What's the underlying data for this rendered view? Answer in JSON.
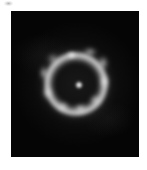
{
  "figure": {
    "name": "einstein-ring-image",
    "kind": "astronomical-image",
    "background_color": "#ffffff",
    "panel": {
      "x": 11,
      "y": 11,
      "width": 128,
      "height": 146,
      "background_color": "#050505"
    },
    "artifact": {
      "label": "",
      "x": 4,
      "y": 1,
      "width": 9,
      "height": 5,
      "color": "#787878"
    }
  },
  "objects": {
    "ring": {
      "label": "",
      "center_x": 65,
      "center_y": 73,
      "radius_x": 34,
      "radius_y": 34,
      "rotation_deg": -6,
      "peak_color": "#bebebe"
    },
    "halo": {
      "label": "",
      "center_x": 65,
      "center_y": 73,
      "radius_x": 40,
      "radius_y": 40,
      "color": "#3c3c3c"
    },
    "center_source": {
      "label": "",
      "x": 68,
      "y": 74,
      "size": 10,
      "color": "#f0f0f0"
    },
    "knots": [
      {
        "label": "",
        "x": 60,
        "y": 44,
        "w": 13,
        "h": 10,
        "brightness": "#e6e6e6",
        "blur": 1.8
      },
      {
        "label": "",
        "x": 79,
        "y": 41,
        "w": 16,
        "h": 10,
        "brightness": "#c8c8c8",
        "blur": 2.2
      },
      {
        "label": "",
        "x": 92,
        "y": 52,
        "w": 12,
        "h": 16,
        "brightness": "#d2d2d2",
        "blur": 2.0
      },
      {
        "label": "",
        "x": 93,
        "y": 70,
        "w": 11,
        "h": 17,
        "brightness": "#dcdcdc",
        "blur": 2.0
      },
      {
        "label": "",
        "x": 84,
        "y": 89,
        "w": 13,
        "h": 12,
        "brightness": "#b4b4b4",
        "blur": 2.2
      },
      {
        "label": "",
        "x": 69,
        "y": 97,
        "w": 15,
        "h": 11,
        "brightness": "#e1e1e1",
        "blur": 2.0
      },
      {
        "label": "",
        "x": 52,
        "y": 95,
        "w": 14,
        "h": 11,
        "brightness": "#cdcdcd",
        "blur": 2.2
      },
      {
        "label": "",
        "x": 36,
        "y": 82,
        "w": 11,
        "h": 14,
        "brightness": "#b9b9b9",
        "blur": 2.2
      },
      {
        "label": "",
        "x": 33,
        "y": 62,
        "w": 10,
        "h": 16,
        "brightness": "#d7d7d7",
        "blur": 2.0
      },
      {
        "label": "",
        "x": 42,
        "y": 48,
        "w": 12,
        "h": 12,
        "brightness": "#b0b0b0",
        "blur": 2.4
      }
    ]
  }
}
